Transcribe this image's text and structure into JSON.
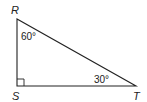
{
  "diagram": {
    "type": "right-triangle",
    "vertices": [
      {
        "name": "R",
        "x": 17,
        "y": 19
      },
      {
        "name": "S",
        "x": 17,
        "y": 86
      },
      {
        "name": "T",
        "x": 136,
        "y": 86
      }
    ],
    "labels": {
      "R": "R",
      "S": "S",
      "T": "T"
    },
    "angles": {
      "R": "60°",
      "T": "30°",
      "S": "right angle"
    },
    "stroke_color": "#222222"
  }
}
